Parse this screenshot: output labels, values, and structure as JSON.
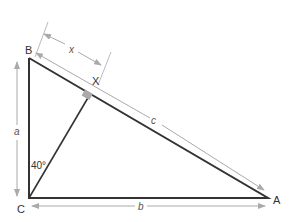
{
  "diagram": {
    "type": "right triangle with altitude",
    "vertices": {
      "B": "B",
      "C": "C",
      "A": "A",
      "X": "X"
    },
    "sides": {
      "a": "a",
      "b": "b",
      "c": "c",
      "x": "x"
    },
    "angle_label": "40°",
    "colors": {
      "line": "#333333",
      "arrow": "#aaaaaa",
      "right_angle": "#999999"
    }
  }
}
